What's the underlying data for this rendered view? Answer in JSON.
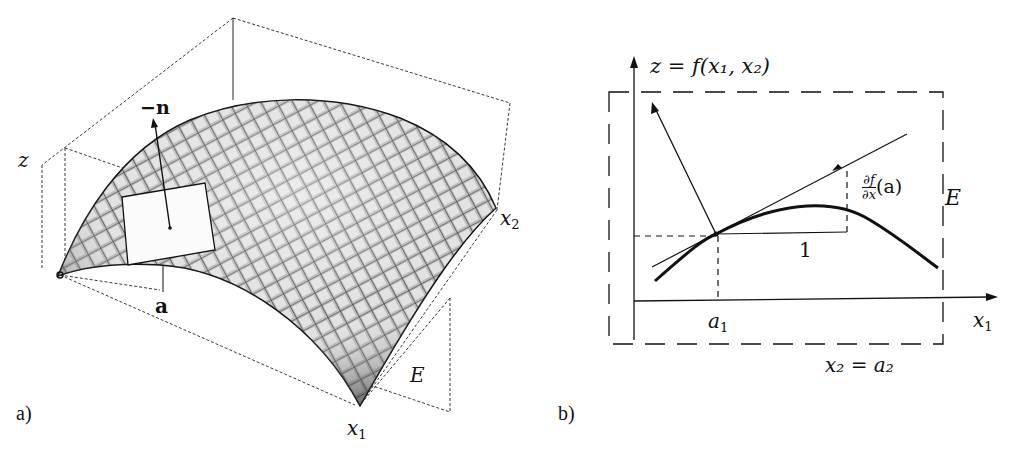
{
  "figure": {
    "panel_a": {
      "label": "a)",
      "axis_z": "z",
      "axis_x1": "x",
      "axis_x1_sub": "1",
      "axis_x2": "x",
      "axis_x2_sub": "2",
      "normal_vector_label": "−n",
      "point_label": "a",
      "plane_label": "E"
    },
    "panel_b": {
      "label": "b)",
      "function_label": "z = f(x₁, x₂)",
      "axis_x1": "x",
      "axis_x1_sub": "1",
      "point_label": "a",
      "point_label_sub": "1",
      "unit_step_label": "1",
      "partial_num": "∂f",
      "partial_den": "∂x",
      "partial_arg": "(a)",
      "plane_label": "E",
      "plane_equation": "x₂ = a₂"
    },
    "colors": {
      "ink": "#111111",
      "surface_dark": "#2a2a2a",
      "surface_light": "#d8d8d8",
      "paper": "#ffffff"
    }
  }
}
